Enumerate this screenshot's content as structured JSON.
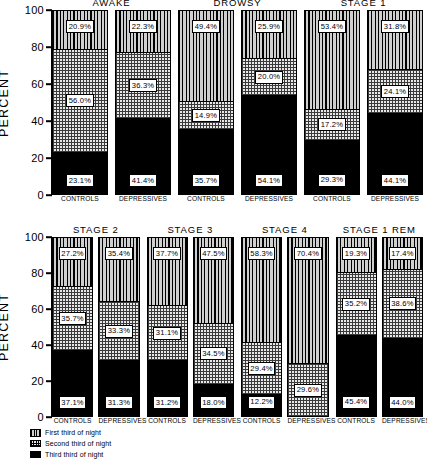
{
  "chart_data": {
    "type": "bar",
    "subtype": "stacked-bar",
    "title": "",
    "xlabel": "",
    "ylabel": "PERCENT",
    "ylim": [
      0,
      100
    ],
    "yticks": [
      "0",
      "20",
      "40",
      "60",
      "80",
      "100"
    ],
    "grid": false,
    "legend_position": "below-left",
    "legend": [
      {
        "key": "first",
        "label": "First third of night",
        "pattern": "vertical-stripes"
      },
      {
        "key": "second",
        "label": "Second third of night",
        "pattern": "checkerboard"
      },
      {
        "key": "third",
        "label": "Third third of night",
        "pattern": "solid-black"
      }
    ],
    "categories": [
      "CONTROLS",
      "DEPRESSIVES"
    ],
    "series": [
      {
        "name": "First third of night",
        "key": "first"
      },
      {
        "name": "Second third of night",
        "key": "second"
      },
      {
        "name": "Third third of night",
        "key": "third"
      }
    ],
    "panels": [
      {
        "name": "top-row",
        "groups": [
          {
            "title": "AWAKE",
            "bars": [
              {
                "category": "CONTROLS",
                "first": 20.9,
                "second": 56.0,
                "third": 23.1,
                "labels": {
                  "first": "20.9%",
                  "second": "56.0%",
                  "third": "23.1%"
                }
              },
              {
                "category": "DEPRESSIVES",
                "first": 22.3,
                "second": 36.3,
                "third": 41.4,
                "labels": {
                  "first": "22.3%",
                  "second": "36.3%",
                  "third": "41.4%"
                }
              }
            ]
          },
          {
            "title": "DROWSY",
            "bars": [
              {
                "category": "CONTROLS",
                "first": 49.4,
                "second": 14.9,
                "third": 35.7,
                "labels": {
                  "first": "49.4%",
                  "second": "14.9%",
                  "third": "35.7%"
                }
              },
              {
                "category": "DEPRESSIVES",
                "first": 25.9,
                "second": 20.0,
                "third": 54.1,
                "labels": {
                  "first": "25.9%",
                  "second": "20.0%",
                  "third": "54.1%"
                }
              }
            ]
          },
          {
            "title": "STAGE 1",
            "bars": [
              {
                "category": "CONTROLS",
                "first": 53.4,
                "second": 17.2,
                "third": 29.3,
                "labels": {
                  "first": "53.4%",
                  "second": "17.2%",
                  "third": "29.3%"
                }
              },
              {
                "category": "DEPRESSIVES",
                "first": 31.8,
                "second": 24.1,
                "third": 44.1,
                "labels": {
                  "first": "31.8%",
                  "second": "24.1%",
                  "third": "44.1%"
                }
              }
            ]
          }
        ]
      },
      {
        "name": "bottom-row",
        "groups": [
          {
            "title": "STAGE 2",
            "bars": [
              {
                "category": "CONTROLS",
                "first": 27.2,
                "second": 35.7,
                "third": 37.1,
                "labels": {
                  "first": "27.2%",
                  "second": "35.7%",
                  "third": "37.1%"
                }
              },
              {
                "category": "DEPRESSIVES",
                "first": 35.4,
                "second": 33.3,
                "third": 31.3,
                "labels": {
                  "first": "35.4%",
                  "second": "33.3%",
                  "third": "31.3%"
                }
              }
            ]
          },
          {
            "title": "STAGE 3",
            "bars": [
              {
                "category": "CONTROLS",
                "first": 37.7,
                "second": 31.1,
                "third": 31.2,
                "labels": {
                  "first": "37.7%",
                  "second": "31.1%",
                  "third": "31.2%"
                }
              },
              {
                "category": "DEPRESSIVES",
                "first": 47.5,
                "second": 34.5,
                "third": 18.0,
                "labels": {
                  "first": "47.5%",
                  "second": "34.5%",
                  "third": "18.0%"
                }
              }
            ]
          },
          {
            "title": "STAGE 4",
            "bars": [
              {
                "category": "CONTROLS",
                "first": 58.3,
                "second": 29.4,
                "third": 12.2,
                "labels": {
                  "first": "58.3%",
                  "second": "29.4%",
                  "third": "12.2%"
                }
              },
              {
                "category": "DEPRESSIVES",
                "first": 70.4,
                "second": 29.6,
                "third": 0.0,
                "labels": {
                  "first": "70.4%",
                  "second": "29.6%",
                  "third": ""
                }
              }
            ]
          },
          {
            "title": "STAGE 1 REM",
            "bars": [
              {
                "category": "CONTROLS",
                "first": 19.3,
                "second": 35.2,
                "third": 45.4,
                "labels": {
                  "first": "19.3%",
                  "second": "35.2%",
                  "third": "45.4%"
                }
              },
              {
                "category": "DEPRESSIVES",
                "first": 17.4,
                "second": 38.6,
                "third": 44.0,
                "labels": {
                  "first": "17.4%",
                  "second": "38.6%",
                  "third": "44.0%"
                }
              }
            ]
          }
        ]
      }
    ]
  }
}
